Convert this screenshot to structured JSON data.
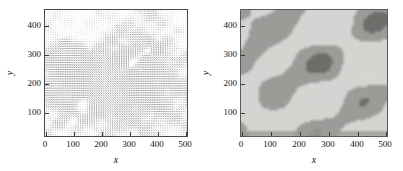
{
  "figure": {
    "panel_count": 2,
    "background": "#ffffff"
  },
  "chart_data": [
    {
      "type": "scatter",
      "subtype": "quiver-vector-field",
      "title": "",
      "xlabel": "x",
      "ylabel": "y",
      "xlim": [
        0,
        510
      ],
      "ylim": [
        0,
        430
      ],
      "xticks": [
        0,
        100,
        200,
        300,
        400,
        500
      ],
      "xticklabels": [
        "0",
        "100",
        "200",
        "300",
        "400",
        "500"
      ],
      "yticks": [
        100,
        200,
        300,
        400
      ],
      "yticklabels": [
        "100",
        "200",
        "300",
        "400"
      ],
      "grid": false,
      "legend": "none",
      "tick_direction": "in",
      "frame": "box",
      "description": "Dense quiver plot of a two-dimensional velocity field on a regular grid; arrow shading encodes local magnitude, with swirling vortical structures near (150,130), (300,230) and (370,290).",
      "vector_color": "#2b2b2b",
      "grid_nx": 62,
      "grid_ny": 54,
      "vortices": [
        {
          "x": 150,
          "y": 130,
          "sense": "counterclockwise",
          "strength": 0.75
        },
        {
          "x": 300,
          "y": 232,
          "sense": "clockwise",
          "strength": 0.95
        },
        {
          "x": 372,
          "y": 292,
          "sense": "clockwise",
          "strength": 0.85
        },
        {
          "x": 95,
          "y": 55,
          "sense": "counterclockwise",
          "strength": 0.55
        },
        {
          "x": 60,
          "y": 330,
          "sense": "clockwise",
          "strength": 0.45
        }
      ]
    },
    {
      "type": "heatmap",
      "subtype": "filled-contour",
      "title": "",
      "xlabel": "x",
      "ylabel": "y",
      "xlim": [
        0,
        510
      ],
      "ylim": [
        0,
        430
      ],
      "xticks": [
        0,
        100,
        200,
        300,
        400,
        500
      ],
      "xticklabels": [
        "0",
        "100",
        "200",
        "300",
        "400",
        "500"
      ],
      "yticks": [
        100,
        200,
        300,
        400
      ],
      "yticklabels": [
        "100",
        "200",
        "300",
        "400"
      ],
      "grid": false,
      "legend": "none",
      "tick_direction": "in",
      "frame": "box",
      "description": "Two-level filled contour map of a scalar field over the same domain; light-gray background denotes low values, medium-gray patches denote values above the first threshold, and small dark-gray cores denote values above the second threshold.",
      "levels": [
        {
          "name": "low",
          "color": "#d4d4d2",
          "share": 0.58
        },
        {
          "name": "mid",
          "color": "#9b9b99",
          "share": 0.38
        },
        {
          "name": "high",
          "color": "#6e6e6c",
          "share": 0.04
        }
      ]
    }
  ],
  "panels": [
    {
      "id": "vector-field-panel",
      "xlabel": "x",
      "ylabel": "y",
      "xticklabels": [
        "0",
        "100",
        "200",
        "300",
        "400",
        "500"
      ],
      "yticklabels": [
        "400",
        "300",
        "200",
        "100"
      ]
    },
    {
      "id": "contour-map-panel",
      "xlabel": "x",
      "ylabel": "y",
      "xticklabels": [
        "0",
        "100",
        "200",
        "300",
        "400",
        "500"
      ],
      "yticklabels": [
        "400",
        "300",
        "200",
        "100"
      ]
    }
  ]
}
